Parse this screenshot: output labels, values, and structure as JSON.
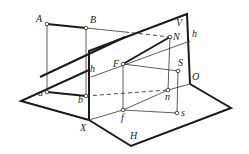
{
  "diagram": {
    "labels": {
      "A": "A",
      "B": "B",
      "V": "V",
      "N": "N",
      "h_upper": "h",
      "h_lower": "h",
      "F": "F",
      "S": "S",
      "O": "O",
      "a": "a",
      "b": "b",
      "n": "n",
      "f": "f",
      "s": "s",
      "X": "X",
      "H": "H"
    },
    "line_color": "#1a1a1a",
    "background": "#ffffff"
  }
}
